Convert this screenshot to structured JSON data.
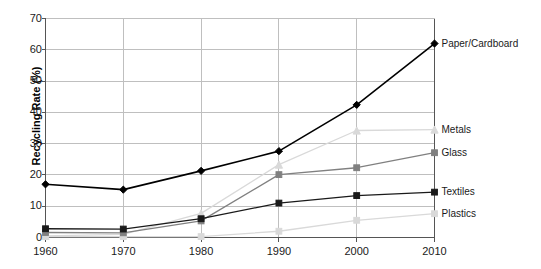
{
  "chart_data": {
    "type": "line",
    "title": "",
    "xlabel": "",
    "ylabel": "Recycling Rate (%)",
    "x": [
      1960,
      1970,
      1980,
      1990,
      2000,
      2010
    ],
    "categories": [
      "1960",
      "1970",
      "1980",
      "1990",
      "2000",
      "2010"
    ],
    "xlim": [
      1960,
      2010
    ],
    "ylim": [
      0,
      70
    ],
    "yticks": [
      0,
      10,
      20,
      30,
      40,
      50,
      60,
      70
    ],
    "ytick_labels": [
      "0",
      "10",
      "20",
      "30",
      "40",
      "50",
      "60",
      "70"
    ],
    "xtick_labels": [
      "1960",
      "1970",
      "1980",
      "1990",
      "2000",
      "2010"
    ],
    "grid": true,
    "legend_position": "right-inline-labels",
    "series": [
      {
        "name": "Paper/Cardboard",
        "color": "#000000",
        "marker": "diamond",
        "values": [
          17.0,
          15.3,
          21.3,
          27.6,
          42.4,
          62.0
        ]
      },
      {
        "name": "Metals",
        "color": "#d9d9d9",
        "marker": "triangle",
        "values": [
          0.5,
          1.0,
          7.7,
          23.3,
          34.2,
          34.5
        ]
      },
      {
        "name": "Glass",
        "color": "#808080",
        "marker": "square",
        "values": [
          1.6,
          1.5,
          5.3,
          20.1,
          22.3,
          27.1
        ]
      },
      {
        "name": "Textiles",
        "color": "#1a1a1a",
        "marker": "square",
        "values": [
          2.8,
          2.7,
          6.0,
          11.0,
          13.4,
          14.5
        ]
      },
      {
        "name": "Plastics",
        "color": "#d9d9d9",
        "marker": "square",
        "values": [
          0.3,
          0.3,
          0.3,
          2.0,
          5.5,
          7.6
        ]
      }
    ]
  },
  "axis": {
    "y_title": "Recycling Rate (%)"
  },
  "colors": {
    "grid": "#bfbfbf",
    "axis": "#555555",
    "background": "#ffffff"
  }
}
